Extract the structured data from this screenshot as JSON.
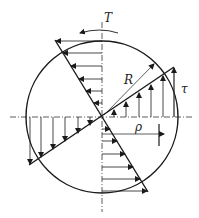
{
  "diagram": {
    "labels": {
      "torque": "T",
      "radius": "R",
      "shear_stress": "τ",
      "rho": "ρ"
    },
    "colors": {
      "stroke": "#1a1a1a",
      "axis": "#333333",
      "background": "#ffffff"
    },
    "geometry": {
      "center": [
        102,
        117
      ],
      "radius": 76
    }
  }
}
